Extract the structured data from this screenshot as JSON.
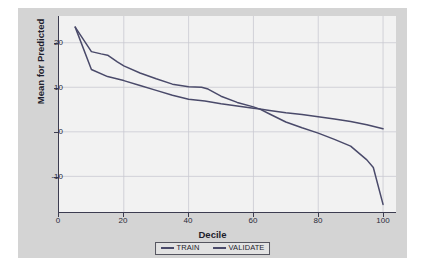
{
  "chart_data": {
    "type": "line",
    "title": "",
    "xlabel": "Decile",
    "ylabel": "Mean for Predicted",
    "xlim": [
      0,
      104
    ],
    "ylim": [
      -18,
      26
    ],
    "xticks": [
      0,
      20,
      40,
      60,
      80,
      100
    ],
    "yticks": [
      20,
      10,
      0,
      -10
    ],
    "grid": true,
    "legend_position": "bottom-center",
    "series": [
      {
        "name": "TRAIN",
        "color": "#4a4a6a",
        "x": [
          5,
          10,
          15,
          20,
          25,
          30,
          35,
          40,
          45,
          50,
          55,
          60,
          62,
          65,
          70,
          75,
          80,
          85,
          90,
          95,
          100
        ],
        "y": [
          23.5,
          14.0,
          12.4,
          11.5,
          10.4,
          9.3,
          8.2,
          7.3,
          6.9,
          6.3,
          5.8,
          5.3,
          5.1,
          4.8,
          4.3,
          3.9,
          3.4,
          2.9,
          2.3,
          1.6,
          0.7
        ]
      },
      {
        "name": "VALIDATE",
        "color": "#4a4a6a",
        "x": [
          5,
          10,
          13,
          15,
          18,
          20,
          25,
          30,
          35,
          40,
          44,
          46,
          50,
          55,
          60,
          62,
          65,
          70,
          75,
          80,
          85,
          90,
          95,
          97,
          100
        ],
        "y": [
          23.5,
          18.0,
          17.5,
          17.2,
          15.7,
          14.8,
          13.2,
          11.9,
          10.7,
          10.1,
          10.0,
          9.6,
          8.0,
          6.6,
          5.6,
          5.1,
          4.0,
          2.2,
          0.9,
          -0.3,
          -1.7,
          -3.2,
          -6.3,
          -8.0,
          -16.3
        ]
      }
    ]
  },
  "legend": {
    "items": [
      {
        "label": "TRAIN",
        "color": "#4a4a6a"
      },
      {
        "label": "VALIDATE",
        "color": "#4a4a6a"
      }
    ]
  },
  "axes": {
    "x_tick_labels": [
      "0",
      "20",
      "40",
      "60",
      "80",
      "100"
    ],
    "y_tick_labels": [
      "20",
      "10",
      "0",
      "-10"
    ]
  }
}
